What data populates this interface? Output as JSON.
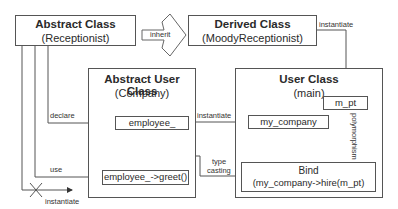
{
  "diagram": {
    "abstract_class": {
      "title": "Abstract Class",
      "name": "(Receptionist)"
    },
    "derived_class": {
      "title": "Derived Class",
      "name": "(MoodyReceptionist)"
    },
    "abstract_user_class": {
      "title": "Abstract User Class",
      "name": "(Company)"
    },
    "user_class": {
      "title": "User Class",
      "name": "(main)"
    },
    "members": {
      "employee": "employee_",
      "greet": "employee_->greet()",
      "my_company": "my_company",
      "m_pt": "m_pt",
      "bind_title": "Bind",
      "bind_call": "(my_company->hire(m_pt)"
    },
    "relations": {
      "inherit": "inherit",
      "instantiate_derived": "instantiate",
      "declare": "declare",
      "use": "use",
      "instantiate_crossed": "instantiate",
      "instantiate_company": "instantiate",
      "polymorphism": "polymorphism",
      "type_casting_1": "type",
      "type_casting_2": "casting"
    },
    "colors": {
      "line": "#555555",
      "text": "#2a2a2a",
      "background": "#ffffff"
    }
  }
}
